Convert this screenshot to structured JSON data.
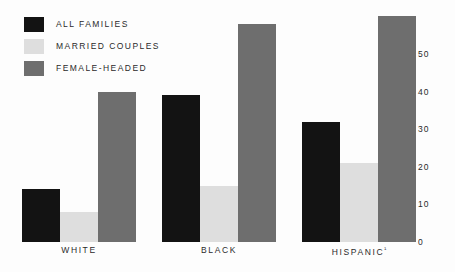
{
  "chart_data": {
    "type": "bar",
    "title": "",
    "subtitle": "",
    "xlabel": "",
    "ylabel": "",
    "categories": [
      "WHITE",
      "BLACK",
      "HISPANIC¹"
    ],
    "series": [
      {
        "name": "ALL FAMILIES",
        "color": "#131313",
        "values": [
          14,
          39,
          32
        ]
      },
      {
        "name": "MARRIED COUPLES",
        "color": "#dedede",
        "values": [
          8,
          15,
          21
        ]
      },
      {
        "name": "FEMALE-HEADED",
        "color": "#6e6e6e",
        "values": [
          40,
          58,
          60
        ]
      }
    ],
    "yticks": [
      0,
      10,
      20,
      30,
      40,
      50
    ],
    "ytick_labels": [
      "0",
      "10",
      "20",
      "30",
      "40",
      "50"
    ],
    "ylim": [
      0,
      62
    ],
    "grid": false,
    "legend_position": "top-left",
    "axis_position": "right",
    "background_color": "#fdfdfd"
  },
  "legend": {
    "items": [
      {
        "label": "ALL FAMILIES",
        "color": "#131313"
      },
      {
        "label": "MARRIED COUPLES",
        "color": "#dedede"
      },
      {
        "label": "FEMALE-HEADED",
        "color": "#6e6e6e"
      }
    ]
  }
}
